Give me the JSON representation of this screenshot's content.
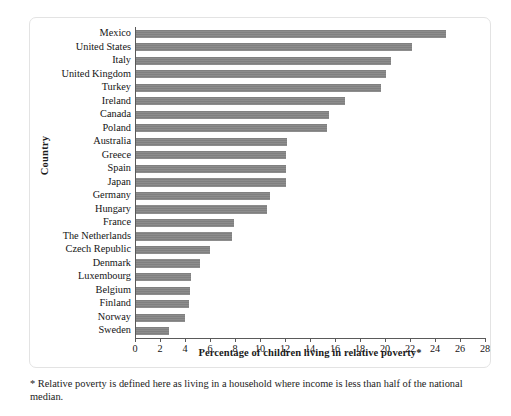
{
  "chart_data": {
    "type": "bar",
    "orientation": "horizontal",
    "title": "",
    "xlabel": "Percentage of children living in relative poverty*",
    "ylabel": "Country",
    "xlim": [
      0,
      28
    ],
    "xticks": [
      0,
      2,
      4,
      6,
      8,
      10,
      12,
      14,
      16,
      18,
      20,
      22,
      24,
      26,
      28
    ],
    "grid": false,
    "legend": null,
    "bar_color": "#808080",
    "categories": [
      "Mexico",
      "United States",
      "Italy",
      "United Kingdom",
      "Turkey",
      "Ireland",
      "Canada",
      "Poland",
      "Australia",
      "Greece",
      "Spain",
      "Japan",
      "Germany",
      "Hungary",
      "France",
      "The Netherlands",
      "Czech Republic",
      "Denmark",
      "Luxembourg",
      "Belgium",
      "Finland",
      "Norway",
      "Sweden"
    ],
    "values": [
      24.8,
      22.1,
      20.4,
      20.0,
      19.6,
      16.7,
      15.4,
      15.3,
      12.1,
      12.0,
      12.0,
      12.0,
      10.7,
      10.5,
      7.8,
      7.7,
      5.9,
      5.1,
      4.4,
      4.3,
      4.2,
      3.9,
      2.6
    ]
  },
  "footnote": {
    "text": "* Relative poverty is defined here as living in a household where income is less than half of the national median."
  }
}
